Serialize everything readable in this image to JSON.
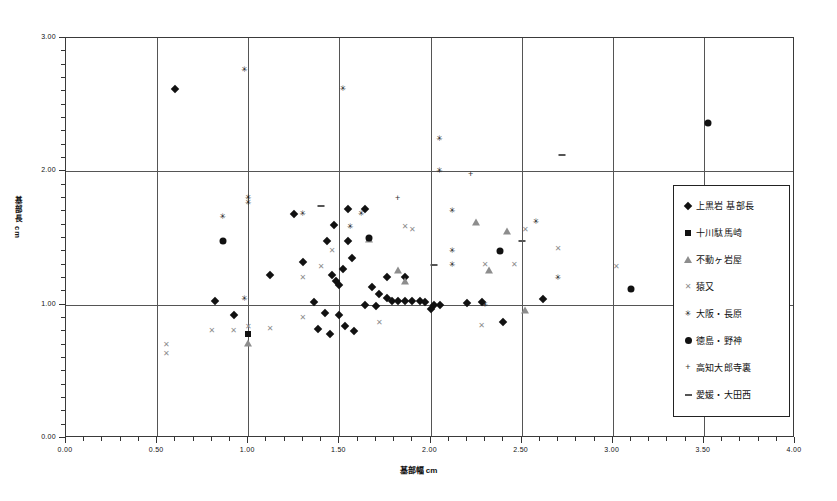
{
  "chart_data": {
    "type": "scatter",
    "title": "",
    "xlabel": "基部幅  cm",
    "ylabel": "基部長  cm",
    "xlim": [
      0.0,
      4.0
    ],
    "ylim": [
      0.0,
      3.0
    ],
    "xticks": [
      "0.00",
      "0.50",
      "1.00",
      "1.50",
      "2.00",
      "2.50",
      "3.00",
      "3.50",
      "4.00"
    ],
    "yticks": [
      "0.00",
      "1.00",
      "2.00",
      "3.00"
    ],
    "grid": true,
    "legend_position": "right-inside",
    "series": [
      {
        "name": "上黒岩 基部長",
        "marker": "diamond",
        "color": "#111111",
        "points": [
          [
            0.6,
            2.62
          ],
          [
            1.25,
            1.68
          ],
          [
            1.47,
            1.6
          ],
          [
            1.55,
            1.72
          ],
          [
            1.43,
            1.48
          ],
          [
            1.55,
            1.48
          ],
          [
            1.64,
            1.72
          ],
          [
            1.3,
            1.32
          ],
          [
            1.57,
            1.35
          ],
          [
            1.52,
            1.27
          ],
          [
            1.12,
            1.22
          ],
          [
            1.46,
            1.22
          ],
          [
            1.48,
            1.18
          ],
          [
            1.5,
            1.15
          ],
          [
            1.76,
            1.21
          ],
          [
            1.86,
            1.21
          ],
          [
            1.68,
            1.13
          ],
          [
            1.72,
            1.08
          ],
          [
            1.76,
            1.05
          ],
          [
            1.79,
            1.03
          ],
          [
            1.82,
            1.03
          ],
          [
            1.86,
            1.03
          ],
          [
            1.9,
            1.03
          ],
          [
            1.94,
            1.03
          ],
          [
            1.97,
            1.02
          ],
          [
            2.02,
            1.0
          ],
          [
            2.05,
            1.0
          ],
          [
            2.0,
            0.97
          ],
          [
            1.64,
            1.0
          ],
          [
            1.7,
            0.99
          ],
          [
            1.36,
            1.02
          ],
          [
            1.42,
            0.94
          ],
          [
            1.5,
            0.92
          ],
          [
            1.53,
            0.84
          ],
          [
            1.58,
            0.8
          ],
          [
            1.45,
            0.78
          ],
          [
            1.38,
            0.82
          ],
          [
            0.82,
            1.03
          ],
          [
            0.92,
            0.92
          ],
          [
            2.2,
            1.01
          ],
          [
            2.28,
            1.02
          ],
          [
            2.62,
            1.04
          ],
          [
            2.4,
            0.87
          ]
        ]
      },
      {
        "name": "十川駄馬崎",
        "marker": "square",
        "color": "#111111",
        "points": [
          [
            1.0,
            0.78
          ]
        ]
      },
      {
        "name": "不動ヶ岩屋",
        "marker": "triangle",
        "color": "#8d8d8d",
        "points": [
          [
            1.0,
            0.71
          ],
          [
            1.82,
            1.26
          ],
          [
            1.66,
            1.49
          ],
          [
            2.25,
            1.62
          ],
          [
            2.42,
            1.55
          ],
          [
            2.32,
            1.26
          ],
          [
            2.52,
            0.96
          ],
          [
            1.86,
            1.18
          ]
        ]
      },
      {
        "name": "猿又",
        "marker": "cross",
        "color": "#8d8d8d",
        "points": [
          [
            0.55,
            0.7
          ],
          [
            0.55,
            0.63
          ],
          [
            0.8,
            0.8
          ],
          [
            0.92,
            0.8
          ],
          [
            1.0,
            0.83
          ],
          [
            1.12,
            0.82
          ],
          [
            1.3,
            0.9
          ],
          [
            1.4,
            1.28
          ],
          [
            1.3,
            1.2
          ],
          [
            1.46,
            1.4
          ],
          [
            1.86,
            1.58
          ],
          [
            1.9,
            1.56
          ],
          [
            2.3,
            1.3
          ],
          [
            2.46,
            1.3
          ],
          [
            2.52,
            1.56
          ],
          [
            2.7,
            1.42
          ],
          [
            2.28,
            0.84
          ],
          [
            1.72,
            0.86
          ],
          [
            3.02,
            1.28
          ]
        ]
      },
      {
        "name": "大阪・長原",
        "marker": "star",
        "color": "#111111",
        "points": [
          [
            0.98,
            2.76
          ],
          [
            1.52,
            2.62
          ],
          [
            1.0,
            1.8
          ],
          [
            1.0,
            1.76
          ],
          [
            0.98,
            1.04
          ],
          [
            0.86,
            1.66
          ],
          [
            1.3,
            1.68
          ],
          [
            1.62,
            1.68
          ],
          [
            1.56,
            1.58
          ],
          [
            2.05,
            2.24
          ],
          [
            2.05,
            2.0
          ],
          [
            2.12,
            1.7
          ],
          [
            2.12,
            1.4
          ],
          [
            2.12,
            1.3
          ],
          [
            2.3,
            1.0
          ],
          [
            2.58,
            1.62
          ],
          [
            2.7,
            1.2
          ]
        ]
      },
      {
        "name": "徳島・野神",
        "marker": "circle",
        "color": "#111111",
        "points": [
          [
            3.52,
            2.36
          ],
          [
            0.86,
            1.48
          ],
          [
            2.38,
            1.4
          ],
          [
            1.66,
            1.5
          ],
          [
            3.1,
            1.12
          ]
        ]
      },
      {
        "name": "高知大郎寺裏",
        "marker": "plus",
        "color": "#333333",
        "points": [
          [
            2.22,
            1.98
          ],
          [
            1.82,
            1.8
          ]
        ]
      },
      {
        "name": "愛媛・大田西",
        "marker": "dash",
        "color": "#555555",
        "points": [
          [
            2.72,
            2.12
          ],
          [
            1.4,
            1.74
          ],
          [
            2.5,
            1.48
          ],
          [
            2.02,
            1.3
          ]
        ]
      }
    ]
  },
  "legend": {
    "items": [
      {
        "label": "上黒岩 基部長",
        "marker": "diamond"
      },
      {
        "label": "十川駄馬崎",
        "marker": "square"
      },
      {
        "label": "不動ヶ岩屋",
        "marker": "triangle"
      },
      {
        "label": "猿又",
        "marker": "cross"
      },
      {
        "label": "大阪・長原",
        "marker": "star"
      },
      {
        "label": "徳島・野神",
        "marker": "circle"
      },
      {
        "label": "高知大郎寺裏",
        "marker": "plus"
      },
      {
        "label": "愛媛・大田西",
        "marker": "dash"
      }
    ]
  }
}
